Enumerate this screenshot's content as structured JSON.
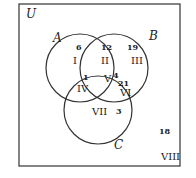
{
  "diagram": {
    "universe_label": "U",
    "sets": [
      {
        "label": "A",
        "cx": 80,
        "cy": 68,
        "r": 34
      },
      {
        "label": "B",
        "cx": 114,
        "cy": 68,
        "r": 34
      },
      {
        "label": "C",
        "cx": 98,
        "cy": 110,
        "r": 34
      }
    ],
    "set_labels": {
      "A": "A",
      "B": "B",
      "C": "C"
    },
    "regions": [
      {
        "roman": "I",
        "count": "6"
      },
      {
        "roman": "II",
        "count": "12"
      },
      {
        "roman": "III",
        "count": "19"
      },
      {
        "roman": "IV",
        "count": "1"
      },
      {
        "roman": "V",
        "count": "4"
      },
      {
        "roman": "VI",
        "count": "21"
      },
      {
        "roman": "VII",
        "count": "3"
      },
      {
        "roman": "VIII",
        "count": "18"
      }
    ],
    "colors": {
      "stroke": "#333333",
      "text": "#222222",
      "background": "#ffffff"
    }
  }
}
